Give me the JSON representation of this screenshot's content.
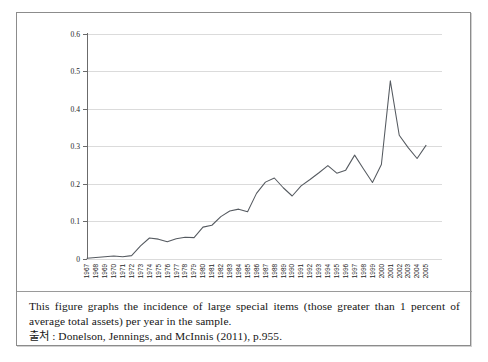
{
  "figure": {
    "caption_body": "This figure graphs the incidence of large special items (those greater than 1 percent of average total assets) per year in the sample.",
    "caption_source": "출처 : Donelson, Jennings, and McInnis (2011), p.955."
  },
  "chart_data": {
    "type": "line",
    "title": "",
    "xlabel": "",
    "ylabel": "",
    "grid": true,
    "legend": false,
    "ylim": [
      0,
      0.6
    ],
    "y_ticks": [
      "0",
      "0.1",
      "0.2",
      "0.3",
      "0.4",
      "0.5",
      "0.6"
    ],
    "y_tick_values": [
      0,
      0.1,
      0.2,
      0.3,
      0.4,
      0.5,
      0.6
    ],
    "categories": [
      "1967",
      "1968",
      "1969",
      "1970",
      "1971",
      "1972",
      "1973",
      "1974",
      "1975",
      "1976",
      "1977",
      "1978",
      "1979",
      "1980",
      "1981",
      "1982",
      "1983",
      "1984",
      "1985",
      "1986",
      "1987",
      "1988",
      "1989",
      "1990",
      "1991",
      "1992",
      "1993",
      "1994",
      "1995",
      "1996",
      "1997",
      "1998",
      "1999",
      "2000",
      "2001",
      "2002",
      "2003",
      "2004",
      "2005"
    ],
    "values": [
      0.002,
      0.004,
      0.006,
      0.008,
      0.006,
      0.009,
      0.035,
      0.056,
      0.053,
      0.046,
      0.054,
      0.058,
      0.057,
      0.085,
      0.09,
      0.113,
      0.128,
      0.133,
      0.126,
      0.175,
      0.205,
      0.216,
      0.19,
      0.168,
      0.195,
      0.212,
      0.23,
      0.249,
      0.229,
      0.237,
      0.277,
      0.24,
      0.204,
      0.252,
      0.253,
      0.293,
      0.366,
      0.332,
      0.324
    ],
    "values_extra": {
      "note": "series continues for final years",
      "tail_years": [
        "2001",
        "2002",
        "2003",
        "2004",
        "2005"
      ],
      "tail_values": [
        0.475,
        0.33,
        0.297,
        0.268,
        0.303
      ]
    },
    "series": [
      {
        "name": "incidence of large special items",
        "values": [
          0.002,
          0.004,
          0.006,
          0.008,
          0.006,
          0.009,
          0.035,
          0.056,
          0.053,
          0.046,
          0.054,
          0.058,
          0.057,
          0.085,
          0.09,
          0.113,
          0.128,
          0.133,
          0.126,
          0.175,
          0.205,
          0.216,
          0.19,
          0.168,
          0.195,
          0.212,
          0.23,
          0.249,
          0.229,
          0.237,
          0.277,
          0.24,
          0.204,
          0.252,
          0.253,
          0.293,
          0.366,
          0.332,
          0.324
        ]
      }
    ],
    "colors": {
      "line": "#555a60",
      "grid": "#d2d2d2",
      "axis": "#6b6b6b",
      "background": "#ffffff"
    }
  }
}
